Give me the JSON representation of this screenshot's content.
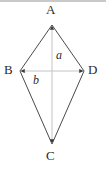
{
  "figure": {
    "kind": "kite-with-diagonals",
    "background_color": "#ffffff",
    "outline_color": "#4a4a4a",
    "diagonal_color": "#bfbfbf",
    "label_color": "#2b2b2b",
    "top_band_color": "#c9c9c9",
    "vertices": {
      "A": {
        "label": "A",
        "x": 52,
        "y": 25
      },
      "B": {
        "label": "B",
        "x": 20,
        "y": 71
      },
      "C": {
        "label": "C",
        "x": 52,
        "y": 144
      },
      "D": {
        "label": "D",
        "x": 84,
        "y": 71
      }
    },
    "diagonals": [
      {
        "name": "vertical-diagonal",
        "label": "a",
        "from": "A",
        "to": "C",
        "x1": 52,
        "y1": 25,
        "x2": 52,
        "y2": 144
      },
      {
        "name": "horizontal-diagonal",
        "label": "b",
        "from": "B",
        "to": "D",
        "x1": 20,
        "y1": 71,
        "x2": 84,
        "y2": 71
      }
    ],
    "edges": [
      {
        "name": "edge-AB",
        "x1": 52,
        "y1": 25,
        "x2": 20,
        "y2": 71
      },
      {
        "name": "edge-AD",
        "x1": 52,
        "y1": 25,
        "x2": 84,
        "y2": 71
      },
      {
        "name": "edge-BC",
        "x1": 20,
        "y1": 71,
        "x2": 52,
        "y2": 144
      },
      {
        "name": "edge-DC",
        "x1": 84,
        "y1": 71,
        "x2": 52,
        "y2": 144
      }
    ]
  }
}
